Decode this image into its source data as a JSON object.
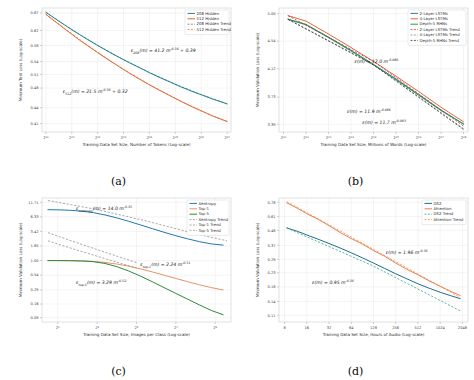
{
  "figure": {
    "background": "#ffffff",
    "panels": [
      "a",
      "b",
      "c",
      "d"
    ]
  },
  "captions": {
    "a": "(a)",
    "b": "(b)",
    "c": "(c)",
    "d": "(d)"
  },
  "chart_data": [
    {
      "id": "a",
      "type": "line",
      "title": "",
      "xlabel": "Training Data Set Size, Number of Tokens (Log-scale)",
      "ylabel": "Minimum Test Loss (Log-scale)",
      "xscale": "log2",
      "yscale": "log",
      "xticklabels": [
        "2^20",
        "2^21",
        "2^22",
        "2^23",
        "2^24",
        "2^25",
        "2^26",
        "2^27"
      ],
      "xtickvalues": [
        20,
        21,
        22,
        23,
        24,
        25,
        26,
        27
      ],
      "yticklabels": [
        "0.67",
        "0.62",
        "0.58",
        "0.54",
        "0.51",
        "0.48",
        "0.44",
        "0.41"
      ],
      "ytickvalues": [
        0.67,
        0.62,
        0.58,
        0.54,
        0.51,
        0.48,
        0.44,
        0.41
      ],
      "ylim": [
        0.395,
        0.685
      ],
      "xlim": [
        19.85,
        27.15
      ],
      "grid": true,
      "legend_position": "upper right",
      "legend": [
        {
          "label": "208 Hidden",
          "color": "#2a7f8e",
          "style": "solid"
        },
        {
          "label": "512 Hidden",
          "color": "#e06a35",
          "style": "solid"
        },
        {
          "label": "208 Hidden Trend",
          "color": "#2a7f8e",
          "style": "dashed"
        },
        {
          "label": "512 Hidden Trend",
          "color": "#e06a35",
          "style": "dashed"
        }
      ],
      "series": [
        {
          "name": "208 Hidden",
          "color": "#2a7f8e",
          "style": "solid",
          "x": [
            20.0,
            20.25,
            20.5,
            20.75,
            21.0,
            21.3,
            21.6,
            22.0,
            22.4,
            22.8,
            23.2,
            23.6,
            24.0,
            24.4,
            24.8,
            25.2,
            25.6,
            26.0,
            26.4,
            26.8,
            27.0
          ],
          "y": [
            0.672,
            0.659,
            0.646,
            0.634,
            0.622,
            0.609,
            0.596,
            0.58,
            0.565,
            0.551,
            0.538,
            0.526,
            0.514,
            0.503,
            0.493,
            0.483,
            0.474,
            0.466,
            0.458,
            0.451,
            0.4475
          ]
        },
        {
          "name": "512 Hidden",
          "color": "#e06a35",
          "style": "solid",
          "x": [
            20.0,
            20.25,
            20.5,
            20.75,
            21.0,
            21.3,
            21.6,
            22.0,
            22.4,
            22.8,
            23.2,
            23.6,
            24.0,
            24.4,
            24.8,
            25.2,
            25.6,
            26.0,
            26.4,
            26.8,
            27.0
          ],
          "y": [
            0.666,
            0.651,
            0.637,
            0.623,
            0.61,
            0.594,
            0.58,
            0.562,
            0.545,
            0.529,
            0.514,
            0.5,
            0.487,
            0.475,
            0.464,
            0.453,
            0.443,
            0.434,
            0.425,
            0.4175,
            0.414
          ]
        },
        {
          "name": "208 Hidden Trend",
          "color": "#2a7f8e",
          "style": "dashed",
          "x": [
            20.0,
            21.0,
            22.0,
            23.0,
            24.0,
            25.0,
            26.0,
            27.0
          ],
          "y": [
            0.6725,
            0.6225,
            0.5805,
            0.5445,
            0.5145,
            0.4885,
            0.4665,
            0.4475
          ]
        },
        {
          "name": "512 Hidden Trend",
          "color": "#e06a35",
          "style": "dashed",
          "x": [
            20.0,
            21.0,
            22.0,
            23.0,
            24.0,
            25.0,
            26.0,
            27.0
          ],
          "y": [
            0.6665,
            0.6105,
            0.5625,
            0.5215,
            0.4875,
            0.4585,
            0.4335,
            0.4135
          ]
        }
      ],
      "annotations": [
        {
          "id": "eq_a_208",
          "base": "ε",
          "sub": "208",
          "mid": "(m) = 41.2 m",
          "sup": "-0.36",
          "tail": " + 0.39",
          "x": 0.47,
          "y": 0.355
        },
        {
          "id": "eq_a_512",
          "base": "ε",
          "sub": "512",
          "mid": "(m) = 21.5 m",
          "sup": "-0.30",
          "tail": " + 0.32",
          "x": 0.11,
          "y": 0.685
        }
      ]
    },
    {
      "id": "b",
      "type": "line",
      "title": "",
      "xlabel": "Training Data Set Size, Millions of Words (Log-scale)",
      "ylabel": "Minimum Validation Loss (Log-scale)",
      "xscale": "log2",
      "yscale": "log",
      "xticklabels": [
        "2^20",
        "2^21",
        "2^22",
        "2^23",
        "2^24",
        "2^25",
        "2^26",
        "2^27",
        "2^28"
      ],
      "xtickvalues": [
        20,
        21,
        22,
        23,
        24,
        25,
        26,
        27,
        28
      ],
      "yticklabels": [
        "5.00",
        "4.54",
        "4.12",
        "3.73",
        "3.39"
      ],
      "ytickvalues": [
        5.0,
        4.54,
        4.12,
        3.73,
        3.39
      ],
      "ylim": [
        3.3,
        5.1
      ],
      "xlim": [
        19.8,
        28.2
      ],
      "grid": true,
      "legend_position": "upper right",
      "legend": [
        {
          "label": "2-Layer LSTMs",
          "color": "#1f77b4",
          "style": "solid"
        },
        {
          "label": "4-Layer LSTMs",
          "color": "#e06a35",
          "style": "solid"
        },
        {
          "label": "Depth-5 RHNs",
          "color": "#2c9e4b",
          "style": "solid"
        },
        {
          "label": "2-Layer LSTMs Trend",
          "color": "#d62728",
          "style": "dashed"
        },
        {
          "label": "4-Layer LSTMs Trend",
          "color": "#7f7f7f",
          "style": "dashed"
        },
        {
          "label": "Depth-5 RHNs Trend",
          "color": "#2a2a2a",
          "style": "dashed"
        }
      ],
      "series": [
        {
          "name": "2-Layer LSTMs",
          "color": "#1f77b4",
          "style": "solid",
          "x": [
            20.2,
            21,
            22,
            23,
            24,
            25,
            26,
            27,
            28
          ],
          "y": [
            4.905,
            4.815,
            4.605,
            4.395,
            4.185,
            3.975,
            3.765,
            3.565,
            3.395
          ]
        },
        {
          "name": "4-Layer LSTMs",
          "color": "#e06a35",
          "style": "solid",
          "x": [
            20.2,
            21,
            22,
            23,
            24,
            25,
            26,
            27,
            28
          ],
          "y": [
            4.965,
            4.87,
            4.655,
            4.44,
            4.228,
            4.015,
            3.805,
            3.6,
            3.42
          ]
        },
        {
          "name": "Depth-5 RHNs",
          "color": "#2c9e4b",
          "style": "solid",
          "x": [
            20.2,
            21,
            22,
            23,
            24,
            25,
            26,
            27,
            28
          ],
          "y": [
            4.9,
            4.808,
            4.596,
            4.386,
            4.176,
            3.966,
            3.757,
            3.558,
            3.392
          ]
        },
        {
          "name": "2-Layer LSTMs Trend",
          "color": "#d62728",
          "style": "dashed",
          "x": [
            20.2,
            24,
            28
          ],
          "y": [
            4.965,
            4.228,
            3.37
          ]
        },
        {
          "name": "4-Layer LSTMs Trend",
          "color": "#7f7f7f",
          "style": "dashed",
          "x": [
            20.2,
            24,
            28
          ],
          "y": [
            4.905,
            4.185,
            3.34
          ]
        },
        {
          "name": "Depth-5 RHNs Trend",
          "color": "#2a2a2a",
          "style": "dashed",
          "x": [
            20.2,
            24,
            28
          ],
          "y": [
            4.9,
            4.176,
            3.33
          ]
        }
      ],
      "annotations": [
        {
          "id": "eq_b_1",
          "base": "ε",
          "sub": "",
          "mid": "(m) = 12.0 m",
          "sup": "-0.086",
          "tail": "",
          "x": 0.4,
          "y": 0.44
        },
        {
          "id": "eq_b_2",
          "base": "ε",
          "sub": "",
          "mid": "(m) = 11.9 m",
          "sup": "-0.086",
          "tail": "",
          "x": 0.36,
          "y": 0.845
        },
        {
          "id": "eq_b_3",
          "base": "ε",
          "sub": "",
          "mid": "(m) = 11.7 m",
          "sup": "-0.083",
          "tail": "",
          "x": 0.44,
          "y": 0.935
        }
      ]
    },
    {
      "id": "c",
      "type": "line",
      "title": "",
      "xlabel": "Training Data Set Size, Images per Class (Log-scale)",
      "ylabel": "Minimum Validation Loss (Log-scale)",
      "xscale": "log2",
      "yscale": "log",
      "xticklabels": [
        "2^1",
        "2^3",
        "2^5",
        "2^7",
        "2^9"
      ],
      "xtickvalues": [
        1,
        3,
        5,
        7,
        9
      ],
      "yticklabels": [
        "11.71",
        "6.33",
        "3.42",
        "1.85",
        "1.00",
        "0.54",
        "0.29",
        "0.16",
        "0.09"
      ],
      "ytickvalues": [
        11.71,
        6.33,
        3.42,
        1.85,
        1.0,
        0.54,
        0.29,
        0.16,
        0.09
      ],
      "ylim": [
        0.075,
        14.0
      ],
      "xlim": [
        0.2,
        9.8
      ],
      "grid": true,
      "legend_position": "upper right",
      "legend": [
        {
          "label": "Xentropy",
          "color": "#1f77b4",
          "style": "solid"
        },
        {
          "label": "Top-1",
          "color": "#e8936a",
          "style": "solid"
        },
        {
          "label": "Top-5",
          "color": "#2c8a3d",
          "style": "solid"
        },
        {
          "label": "Xentropy Trend",
          "color": "#8c8c8c",
          "style": "dashed"
        },
        {
          "label": "Top-1 Trend",
          "color": "#8c8c8c",
          "style": "dashed"
        },
        {
          "label": "Top-5 Trend",
          "color": "#8c8c8c",
          "style": "dashed"
        }
      ],
      "series": [
        {
          "name": "Xentropy",
          "color": "#1f77b4",
          "style": "solid",
          "x": [
            0.5,
            1.0,
            1.6,
            2.2,
            2.8,
            3.4,
            4.0,
            4.6,
            5.2,
            5.8,
            6.4,
            7.0,
            7.6,
            8.2,
            8.8,
            9.4
          ],
          "y": [
            8.55,
            8.5,
            8.35,
            8.05,
            7.55,
            6.85,
            6.05,
            5.25,
            4.5,
            3.85,
            3.3,
            2.85,
            2.5,
            2.22,
            2.02,
            1.92
          ]
        },
        {
          "name": "Top-1",
          "color": "#e8936a",
          "style": "solid",
          "x": [
            0.5,
            1.0,
            1.6,
            2.2,
            2.8,
            3.4,
            4.0,
            4.6,
            5.2,
            5.8,
            6.4,
            7.0,
            7.6,
            8.2,
            8.8,
            9.4
          ],
          "y": [
            1.0,
            1.0,
            0.995,
            0.985,
            0.965,
            0.925,
            0.865,
            0.79,
            0.705,
            0.62,
            0.54,
            0.47,
            0.41,
            0.36,
            0.32,
            0.29
          ]
        },
        {
          "name": "Top-5",
          "color": "#2c8a3d",
          "style": "solid",
          "x": [
            0.5,
            1.0,
            1.6,
            2.2,
            2.8,
            3.4,
            4.0,
            4.6,
            5.2,
            5.8,
            6.4,
            7.0,
            7.6,
            8.2,
            8.8,
            9.4
          ],
          "y": [
            1.0,
            1.0,
            0.995,
            0.985,
            0.955,
            0.885,
            0.775,
            0.645,
            0.52,
            0.41,
            0.32,
            0.25,
            0.196,
            0.154,
            0.122,
            0.102
          ]
        },
        {
          "name": "Xentropy Trend",
          "color": "#8c8c8c",
          "style": "dashed",
          "x": [
            0.5,
            3.0,
            5.5,
            8.0,
            9.6
          ],
          "y": [
            12.6,
            8.6,
            5.3,
            3.1,
            2.3
          ]
        },
        {
          "name": "Top-1 Trend",
          "color": "#8c8c8c",
          "style": "dashed",
          "x": [
            0.5,
            2.0,
            3.5,
            5.0
          ],
          "y": [
            3.25,
            2.1,
            1.38,
            0.92
          ]
        },
        {
          "name": "Top-5 Trend",
          "color": "#8c8c8c",
          "style": "dashed",
          "x": [
            0.5,
            2.0,
            3.5,
            5.0
          ],
          "y": [
            2.3,
            1.55,
            1.06,
            0.73
          ]
        }
      ],
      "annotations": [
        {
          "id": "eq_c_xent",
          "base": "ε",
          "sub": "xentropy",
          "mid": "(m) = 14.0 m",
          "sup": "-0.35",
          "tail": "",
          "x": 0.18,
          "y": 0.095
        },
        {
          "id": "eq_c_top1",
          "base": "ε",
          "sub": "top-1",
          "mid": "(m) = 2.24 m",
          "sup": "-0.31",
          "tail": "",
          "x": 0.52,
          "y": 0.545
        },
        {
          "id": "eq_c_top5",
          "base": "ε",
          "sub": "top-5",
          "mid": "(m) = 3.29 m",
          "sup": "-0.52",
          "tail": "",
          "x": 0.18,
          "y": 0.695
        }
      ]
    },
    {
      "id": "d",
      "type": "line",
      "title": "",
      "xlabel": "Training Data Set Size, Hours of Audio (Log-scale)",
      "ylabel": "Minimum Validation Loss (Log-scale)",
      "xscale": "log2",
      "yscale": "log",
      "xticklabels": [
        "8",
        "16",
        "32",
        "64",
        "128",
        "256",
        "512",
        "1024",
        "2048"
      ],
      "xtickvalues": [
        3,
        4,
        5,
        6,
        7,
        8,
        9,
        10,
        11
      ],
      "yticklabels": [
        "0.78",
        "0.61",
        "0.48",
        "0.37",
        "0.29",
        "0.23",
        "0.18",
        "0.14",
        "0.11"
      ],
      "ytickvalues": [
        0.78,
        0.61,
        0.48,
        0.37,
        0.29,
        0.23,
        0.18,
        0.14,
        0.11
      ],
      "ylim": [
        0.098,
        0.84
      ],
      "xlim": [
        2.75,
        11.25
      ],
      "grid": true,
      "legend_position": "upper right",
      "legend": [
        {
          "label": "DS2",
          "color": "#1f6f8b",
          "style": "solid"
        },
        {
          "label": "Attention",
          "color": "#e8834e",
          "style": "solid"
        },
        {
          "label": "DS2 Trend",
          "color": "#2a9d8f",
          "style": "dashed"
        },
        {
          "label": "Attention Trend",
          "color": "#e8834e",
          "style": "dashed"
        }
      ],
      "series": [
        {
          "name": "DS2",
          "color": "#1f6f8b",
          "style": "solid",
          "x": [
            3.1,
            3.6,
            4.0,
            4.5,
            5.0,
            5.5,
            6.0,
            6.5,
            7.0,
            7.5,
            8.0,
            8.5,
            9.0,
            9.5,
            10.0,
            10.5,
            10.9
          ],
          "y": [
            0.5,
            0.47,
            0.443,
            0.412,
            0.382,
            0.353,
            0.325,
            0.298,
            0.272,
            0.248,
            0.226,
            0.207,
            0.19,
            0.176,
            0.164,
            0.154,
            0.147
          ]
        },
        {
          "name": "Attention",
          "color": "#e8834e",
          "style": "solid",
          "x": [
            3.1,
            3.6,
            4.0,
            4.5,
            5.0,
            5.5,
            6.0,
            6.5,
            7.0,
            7.5,
            8.0,
            8.5,
            9.0,
            9.5,
            10.0,
            10.5,
            10.9
          ],
          "y": [
            0.772,
            0.7,
            0.64,
            0.582,
            0.52,
            0.462,
            0.416,
            0.378,
            0.338,
            0.306,
            0.272,
            0.244,
            0.222,
            0.2,
            0.182,
            0.166,
            0.155
          ]
        },
        {
          "name": "DS2 Trend",
          "color": "#2a9d8f",
          "style": "dashed",
          "x": [
            3.1,
            7.0,
            10.9
          ],
          "y": [
            0.5,
            0.258,
            0.119
          ]
        },
        {
          "name": "Attention Trend",
          "color": "#e8834e",
          "style": "dashed",
          "x": [
            3.1,
            7.0,
            10.9
          ],
          "y": [
            0.79,
            0.345,
            0.15
          ]
        }
      ],
      "annotations": [
        {
          "id": "eq_d_att",
          "base": "ε",
          "sub": "",
          "mid": "(m) = 1.96 m",
          "sup": "-0.30",
          "tail": "",
          "x": 0.565,
          "y": 0.455
        },
        {
          "id": "eq_d_ds2",
          "base": "ε",
          "sub": "",
          "mid": "(m) = 0.95 m",
          "sup": "-0.30",
          "tail": "",
          "x": 0.175,
          "y": 0.695
        }
      ]
    }
  ]
}
